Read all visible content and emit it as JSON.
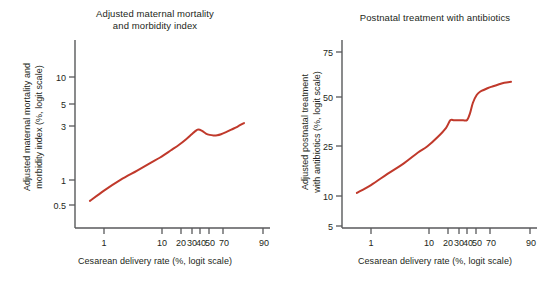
{
  "figure": {
    "background": "#ffffff",
    "line_color": "#c0392b",
    "axis_color": "#58595b",
    "text_color": "#231f20"
  },
  "panels": [
    {
      "id": "maternal-mortality",
      "title": "Adjusted maternal mortality\nand morbidity index",
      "title_line1": "Adjusted maternal mortality",
      "title_line2": "and morbidity index",
      "ylabel": "Adjusted maternal mortality and\nmorbidity index (%, logit scale)",
      "xlabel": "Cesarean delivery rate (%, logit scale)"
    },
    {
      "id": "postnatal-antibiotics",
      "title": "Postnatal treatment with antibiotics",
      "title_line1": "Postnatal treatment with antibiotics",
      "title_line2": "",
      "ylabel": "Adjusted postnatal treatment\nwith antibiotics (%, logit scale)",
      "xlabel": "Cesarean delivery rate (%, logit scale)"
    }
  ],
  "chart_data": [
    {
      "type": "line",
      "id": "maternal-mortality",
      "title": "Adjusted maternal mortality and morbidity index",
      "xlabel": "Cesarean delivery rate (%, logit scale)",
      "ylabel": "Adjusted maternal mortality and morbidity index (%, logit scale)",
      "xscale": "logit",
      "yscale": "log",
      "grid": false,
      "legend": null,
      "xticks": [
        1,
        10,
        20,
        30,
        40,
        50,
        70,
        90
      ],
      "xticklabels": [
        "1",
        "10",
        "20",
        "30",
        "40",
        "50",
        "70",
        "90"
      ],
      "yticks": [
        0.5,
        1,
        3,
        5,
        10
      ],
      "yticklabels": [
        "0.5",
        "1",
        "3",
        "5",
        "10"
      ],
      "xlim": [
        0.45,
        92
      ],
      "ylim": [
        0.35,
        20
      ],
      "series": [
        {
          "name": "Adjusted maternal mortality and morbidity index",
          "color": "#c0392b",
          "x": [
            0.55,
            1,
            2,
            4,
            7,
            10,
            15,
            20,
            25,
            30,
            33,
            36,
            40,
            44,
            48,
            52,
            56,
            60,
            65,
            70,
            75,
            80
          ],
          "y": [
            0.55,
            0.7,
            0.9,
            1.12,
            1.35,
            1.52,
            1.8,
            2.05,
            2.32,
            2.62,
            2.8,
            2.92,
            2.83,
            2.66,
            2.58,
            2.55,
            2.56,
            2.62,
            2.75,
            2.92,
            3.12,
            3.4
          ]
        }
      ]
    },
    {
      "type": "line",
      "id": "postnatal-antibiotics",
      "title": "Postnatal treatment with antibiotics",
      "xlabel": "Cesarean delivery rate (%, logit scale)",
      "ylabel": "Adjusted postnatal treatment with antibiotics (%, logit scale)",
      "xscale": "logit",
      "yscale": "logit",
      "grid": false,
      "legend": null,
      "xticks": [
        1,
        10,
        20,
        30,
        40,
        50,
        70,
        90
      ],
      "xticklabels": [
        "1",
        "10",
        "20",
        "30",
        "40",
        "50",
        "70",
        "90"
      ],
      "yticks": [
        5,
        10,
        25,
        50,
        75
      ],
      "yticklabels": [
        "5",
        "10",
        "25",
        "50",
        "75"
      ],
      "xlim": [
        0.45,
        92
      ],
      "ylim": [
        4,
        85
      ],
      "series": [
        {
          "name": "Adjusted postnatal treatment with antibiotics",
          "color": "#c0392b",
          "x": [
            0.55,
            1,
            2,
            4,
            7,
            10,
            15,
            20,
            23,
            26,
            30,
            34,
            38,
            41,
            44,
            48,
            52,
            56,
            60,
            65,
            70,
            75,
            80
          ],
          "y": [
            10.2,
            12.0,
            15.0,
            18.5,
            22.5,
            25.0,
            29.5,
            34.0,
            38.0,
            38.0,
            38.0,
            38.0,
            38.2,
            42.0,
            48.0,
            52.5,
            54.5,
            55.5,
            56.5,
            57.5,
            58.5,
            59.5,
            60.0
          ]
        }
      ]
    }
  ]
}
